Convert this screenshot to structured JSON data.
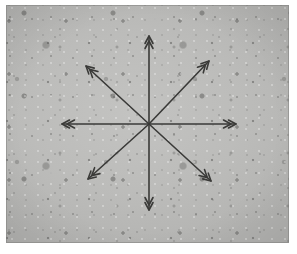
{
  "figure": {
    "kind": "grayscale-photomicrograph-with-annotation",
    "background_color": "#bcbcba",
    "page_color": "#ffffff",
    "arrow_color": "#3a3a38",
    "frame": {
      "x": 6,
      "y": 5,
      "width": 283,
      "height": 238
    }
  },
  "chart_data": {
    "type": "scatter",
    "title": "",
    "xlabel": "",
    "ylabel": "",
    "center": {
      "x": 149,
      "y": 124
    },
    "arrow_style": "double-chevron both ends",
    "stroke_width": 1.6,
    "series": [
      {
        "name": "radial-arrows",
        "points": [
          {
            "label": "up",
            "angle_deg": 90,
            "tip_x": 149,
            "tip_y": 36
          },
          {
            "label": "up-right",
            "angle_deg": 45,
            "tip_x": 209,
            "tip_y": 61
          },
          {
            "label": "right",
            "angle_deg": 0,
            "tip_x": 236,
            "tip_y": 124
          },
          {
            "label": "down-right",
            "angle_deg": 315,
            "tip_x": 211,
            "tip_y": 181
          },
          {
            "label": "down",
            "angle_deg": 270,
            "tip_x": 149,
            "tip_y": 210
          },
          {
            "label": "down-left",
            "angle_deg": 225,
            "tip_x": 88,
            "tip_y": 179
          },
          {
            "label": "left",
            "angle_deg": 180,
            "tip_x": 62,
            "tip_y": 124
          },
          {
            "label": "up-left",
            "angle_deg": 135,
            "tip_x": 86,
            "tip_y": 66
          }
        ]
      }
    ]
  }
}
